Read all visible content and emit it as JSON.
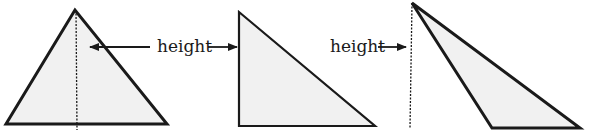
{
  "diagram": {
    "colors": {
      "stroke": "#1a1a1a",
      "fill": "#f1f1f1",
      "background": "#ffffff"
    },
    "triangles": [
      {
        "name": "acute-triangle",
        "points": [
          [
            75,
            10
          ],
          [
            6,
            124
          ],
          [
            167,
            124
          ]
        ],
        "height_line": [
          [
            76,
            10
          ],
          [
            77,
            130
          ]
        ],
        "height_style": "dashed",
        "label": "height",
        "label_pos": [
          157,
          38
        ],
        "arrow": {
          "from": [
            150,
            47
          ],
          "to": [
            90,
            47
          ],
          "direction": "left"
        }
      },
      {
        "name": "right-triangle",
        "points": [
          [
            239,
            12
          ],
          [
            239,
            126
          ],
          [
            375,
            126
          ]
        ],
        "height_line": null,
        "height_style": "side",
        "label": "height",
        "label_pos": [
          157,
          38
        ],
        "arrow": {
          "from": [
            208,
            47
          ],
          "to": [
            237,
            47
          ],
          "direction": "right"
        }
      },
      {
        "name": "obtuse-triangle",
        "points": [
          [
            412,
            3
          ],
          [
            492,
            128
          ],
          [
            580,
            128
          ]
        ],
        "height_line": [
          [
            412,
            3
          ],
          [
            410,
            128
          ]
        ],
        "height_style": "dashed",
        "label": "height",
        "label_pos": [
          332,
          38
        ],
        "arrow": {
          "from": [
            378,
            47
          ],
          "to": [
            406,
            47
          ],
          "direction": "right"
        }
      }
    ],
    "labels": [
      {
        "text": "height",
        "x": 157,
        "y": 38
      },
      {
        "text": "height",
        "x": 330,
        "y": 38
      }
    ]
  }
}
